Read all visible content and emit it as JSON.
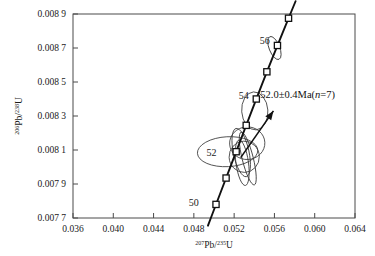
{
  "chart_data": {
    "type": "scatter",
    "title": "",
    "xlabel": "207Pb/235U",
    "xlabel_parts": {
      "sup1": "207",
      "mid": "Pb/",
      "sup2": "235",
      "tail": "U"
    },
    "ylabel": "206Pb/238U",
    "ylabel_parts": {
      "sup1": "206",
      "mid": "Pb/",
      "sup2": "238",
      "tail": "U"
    },
    "xlim": [
      0.036,
      0.064
    ],
    "ylim": [
      0.0077,
      0.0089
    ],
    "xticks": [
      0.036,
      0.04,
      0.044,
      0.048,
      0.052,
      0.056,
      0.06,
      0.064
    ],
    "xtick_labels": [
      "0.036",
      "0.040",
      "0.044",
      "0.048",
      "0.052",
      "0.056",
      "0.060",
      "0.064"
    ],
    "yticks": [
      0.0089,
      0.0087,
      0.0085,
      0.0083,
      0.0081,
      0.0079,
      0.0077
    ],
    "ytick_labels": [
      "0.008 9",
      "0.008 7",
      "0.008 5",
      "0.008 3",
      "0.008 1",
      "0.007 9",
      "0.007 7"
    ],
    "grid": false,
    "legend": "none",
    "concordia_curve": {
      "name": "Concordia",
      "age_unit": "Ma",
      "points": [
        {
          "age": 49.2,
          "x": 0.0494,
          "y": 0.007655
        },
        {
          "age": 50,
          "x": 0.0502,
          "y": 0.00778
        },
        {
          "age": 51,
          "x": 0.0512,
          "y": 0.007935
        },
        {
          "age": 52,
          "x": 0.0522,
          "y": 0.00809
        },
        {
          "age": 53,
          "x": 0.0532,
          "y": 0.008245
        },
        {
          "age": 54,
          "x": 0.0542,
          "y": 0.0084
        },
        {
          "age": 55,
          "x": 0.05525,
          "y": 0.00856
        },
        {
          "age": 56,
          "x": 0.0563,
          "y": 0.008715
        },
        {
          "age": 57,
          "x": 0.0574,
          "y": 0.008875
        },
        {
          "age": 57.6,
          "x": 0.0581,
          "y": 0.008975
        }
      ]
    },
    "concordia_markers": [
      {
        "age": 50,
        "x": 0.0502,
        "y": 0.00778,
        "label": "50",
        "label_shown": true
      },
      {
        "age": 51,
        "x": 0.0512,
        "y": 0.007935,
        "label": "51",
        "label_shown": false
      },
      {
        "age": 52,
        "x": 0.0522,
        "y": 0.00809,
        "label": "52",
        "label_shown": true
      },
      {
        "age": 53,
        "x": 0.0532,
        "y": 0.008245,
        "label": "53",
        "label_shown": false
      },
      {
        "age": 54,
        "x": 0.0542,
        "y": 0.0084,
        "label": "54",
        "label_shown": true
      },
      {
        "age": 55,
        "x": 0.05525,
        "y": 0.00856,
        "label": "55",
        "label_shown": false
      },
      {
        "age": 56,
        "x": 0.0563,
        "y": 0.008715,
        "label": "56",
        "label_shown": true
      },
      {
        "age": 57,
        "x": 0.0574,
        "y": 0.008875,
        "label": "57",
        "label_shown": false
      }
    ],
    "age_tick_labels": [
      {
        "text": "50",
        "x": 0.048,
        "y": 0.00779
      },
      {
        "text": "52",
        "x": 0.04975,
        "y": 0.008085
      },
      {
        "text": "54",
        "x": 0.05295,
        "y": 0.00842
      },
      {
        "text": "56",
        "x": 0.05505,
        "y": 0.008745
      }
    ],
    "error_ellipses": [
      {
        "id": "e1",
        "cx": 0.05405,
        "cy": 0.00833,
        "rx": 0.0013,
        "ry": 0.000112,
        "rotation": -4
      },
      {
        "id": "e2",
        "cx": 0.05135,
        "cy": 0.00809,
        "rx": 0.003,
        "ry": 8.8e-05,
        "rotation": -3
      },
      {
        "id": "e3",
        "cx": 0.0533,
        "cy": 0.00814,
        "rx": 0.00175,
        "ry": 9.6e-05,
        "rotation": -3
      },
      {
        "id": "e4",
        "cx": 0.053,
        "cy": 0.00806,
        "rx": 0.0015,
        "ry": 9.2e-05,
        "rotation": -2
      },
      {
        "id": "e5",
        "cx": 0.0527,
        "cy": 0.008085,
        "rx": 0.00078,
        "ry": 0.000145,
        "rotation": -12
      },
      {
        "id": "e6",
        "cx": 0.05335,
        "cy": 0.00805,
        "rx": 0.00055,
        "ry": 0.00016,
        "rotation": -14
      },
      {
        "id": "e7",
        "cx": 0.0528,
        "cy": 0.008025,
        "rx": 0.00062,
        "ry": 0.000135,
        "rotation": -8
      },
      {
        "id": "e8",
        "cx": 0.056,
        "cy": 0.0087,
        "rx": 0.00052,
        "ry": 7.2e-05,
        "rotation": -22
      }
    ],
    "annotation": {
      "text": "52.0±0.4Ma(n=7)",
      "prefix": "52.0±0.4Ma(",
      "italic": "n",
      "suffix": "=7)",
      "x": 0.0546,
      "y": 0.008405
    },
    "pointer_arrow": {
      "from_x": 0.05265,
      "from_y": 0.008055,
      "to_x": 0.0559,
      "to_y": 0.00833
    }
  },
  "colors": {
    "curve": "#111111",
    "marker_fill": "#ffffff",
    "marker_stroke": "#111111",
    "ellipse": "#3a3a3a",
    "frame": "#4a4a4a",
    "text": "#1a1a1a",
    "background": "#ffffff"
  }
}
